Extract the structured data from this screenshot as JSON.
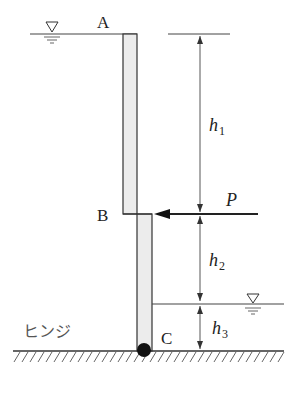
{
  "diagram": {
    "type": "hinged wall with water levels and horizontal load",
    "points": {
      "A": "A",
      "B": "B",
      "C": "C"
    },
    "force": {
      "label": "P",
      "direction": "leftward",
      "applied_at": "B"
    },
    "dimensions": {
      "h1": {
        "base": "h",
        "sub": "1",
        "span": "A to B"
      },
      "h2": {
        "base": "h",
        "sub": "2",
        "span": "B to lower water surface"
      },
      "h3": {
        "base": "h",
        "sub": "3",
        "span": "lower water surface to C"
      }
    },
    "support_label": "ヒンジ",
    "water_surface_symbols": [
      "upper-left water surface ▽",
      "lower-right water surface ▽"
    ],
    "colors": {
      "line": "#333333",
      "wall_fill": "#ececec",
      "hinge": "#111111"
    }
  }
}
